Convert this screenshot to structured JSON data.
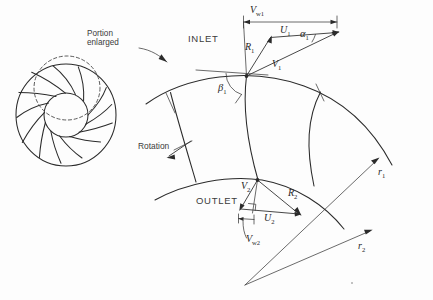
{
  "figure": {
    "background_color": "#fdfdfd",
    "ink_color": "#2b2b2b"
  },
  "callout": {
    "note_line1": "Portion",
    "note_line2": "enlarged",
    "arrow_name": "portion-enlarged-arrow"
  },
  "sections": {
    "inlet_label": "INLET",
    "outlet_label": "OUTLET",
    "rotation_label": "Rotation"
  },
  "inlet_triangle": {
    "vw1": {
      "symbol": "V",
      "sub": "w1",
      "display": "Vw1"
    },
    "u1": {
      "symbol": "U",
      "sub": "1",
      "display": "U1"
    },
    "v1": {
      "symbol": "V",
      "sub": "1",
      "display": "V1"
    },
    "r1_vec": {
      "symbol": "R",
      "sub": "1",
      "display": "R1"
    },
    "alpha1": {
      "symbol": "α",
      "sub": "1",
      "display": "α1"
    },
    "beta1": {
      "symbol": "β",
      "sub": "1",
      "display": "β1"
    }
  },
  "outlet_triangle": {
    "v2": {
      "symbol": "V",
      "sub": "2",
      "display": "V2"
    },
    "u2": {
      "symbol": "U",
      "sub": "2",
      "display": "U2"
    },
    "r2_vec": {
      "symbol": "R",
      "sub": "2",
      "display": "R2"
    },
    "vw2": {
      "symbol": "V",
      "sub": "w2",
      "display": "Vw2"
    }
  },
  "radii": {
    "r1": {
      "symbol": "r",
      "sub": "1",
      "display": "r1"
    },
    "r2": {
      "symbol": "r",
      "sub": "2",
      "display": "r2"
    }
  },
  "impeller": {
    "vane_count": 13,
    "outer_radius": 50,
    "hub_radius": 22,
    "center_x": 66,
    "center_y": 115,
    "highlight_circle": {
      "cx": 67,
      "cy": 88,
      "r": 33,
      "style": "dashed"
    }
  }
}
